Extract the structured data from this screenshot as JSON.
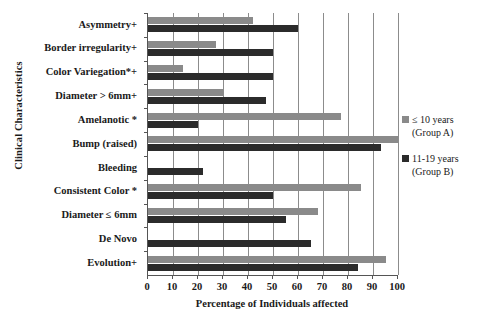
{
  "chart_data": {
    "type": "bar",
    "orientation": "horizontal",
    "title": "",
    "xlabel": "Percentage of Individuals affected",
    "ylabel": "Clinical Characteristics",
    "xlim": [
      0,
      100
    ],
    "xticks": [
      0,
      10,
      20,
      30,
      40,
      50,
      60,
      70,
      80,
      90,
      100
    ],
    "grid": true,
    "legend_position": "right",
    "categories": [
      "Asymmetry+",
      "Border irregularity+",
      "Color Variegation*+",
      "Diameter > 6mm+",
      "Amelanotic *",
      "Bump (raised)",
      "Bleeding",
      "Consistent Color *",
      "Diameter ≤ 6mm",
      "De Novo",
      "Evolution+"
    ],
    "series": [
      {
        "name": "≤ 10 years (Group A)",
        "color": "#8a8a8a",
        "values": [
          42,
          27,
          14,
          30,
          77,
          100,
          0,
          85,
          68,
          0,
          95
        ]
      },
      {
        "name": "11-19 years (Group B)",
        "color": "#2b2b2b",
        "values": [
          60,
          50,
          50,
          47,
          20,
          93,
          22,
          50,
          55,
          65,
          84
        ]
      }
    ]
  },
  "legend": {
    "entries": [
      {
        "label": "≤ 10 years\n(Group A)",
        "color": "#8a8a8a"
      },
      {
        "label": "11-19 years\n(Group B)",
        "color": "#2b2b2b"
      }
    ]
  },
  "axes": {
    "x_title": "Percentage of Individuals affected",
    "y_title": "Clinical Characteristics",
    "x_tick_labels": [
      "0",
      "10",
      "20",
      "30",
      "40",
      "50",
      "60",
      "70",
      "80",
      "90",
      "100"
    ]
  }
}
